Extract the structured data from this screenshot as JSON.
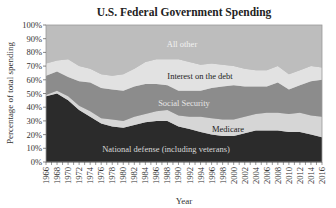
{
  "chart_data": {
    "type": "area",
    "stacked": true,
    "title": "U.S. Federal Government Spending",
    "xlabel": "Year",
    "ylabel": "Percentage of total spending",
    "ylim": [
      0,
      100
    ],
    "yticks": [
      "0%",
      "10%",
      "20%",
      "30%",
      "40%",
      "50%",
      "60%",
      "70%",
      "80%",
      "90%",
      "100%"
    ],
    "x": [
      1966,
      1968,
      1970,
      1972,
      1974,
      1976,
      1978,
      1980,
      1982,
      1984,
      1986,
      1988,
      1990,
      1992,
      1994,
      1996,
      1998,
      2000,
      2002,
      2004,
      2006,
      2008,
      2010,
      2012,
      2014,
      2016
    ],
    "xticks": [
      "1966",
      "1968",
      "1970",
      "1972",
      "1974",
      "1976",
      "1978",
      "1980",
      "1982",
      "1984",
      "1986",
      "1988",
      "1990",
      "1992",
      "1994",
      "1996",
      "1998",
      "2000",
      "2002",
      "2004",
      "2006",
      "2008",
      "2010",
      "2012",
      "2014",
      "2016"
    ],
    "grid": false,
    "series": [
      {
        "name": "National defense (including veterans)",
        "color": "#2b2b2b",
        "label_color": "#d8d8d8",
        "values": [
          48,
          50,
          45,
          38,
          33,
          28,
          26,
          25,
          27,
          29,
          30,
          30,
          26,
          24,
          22,
          20,
          19,
          19,
          21,
          23,
          23,
          23,
          22,
          22,
          20,
          18
        ]
      },
      {
        "name": "Medicare",
        "color": "#d6d6d6",
        "label_color": "#222222",
        "values": [
          1,
          2,
          3,
          3,
          4,
          4,
          5,
          5,
          6,
          6,
          7,
          8,
          8,
          9,
          11,
          12,
          12,
          12,
          12,
          12,
          13,
          13,
          13,
          14,
          14,
          15
        ]
      },
      {
        "name": "Social Security",
        "color": "#8c8c8c",
        "label_color": "#e6e6e6",
        "values": [
          14,
          14,
          14,
          18,
          21,
          22,
          22,
          22,
          22,
          22,
          20,
          18,
          18,
          19,
          19,
          22,
          24,
          25,
          22,
          20,
          19,
          22,
          18,
          20,
          25,
          27
        ]
      },
      {
        "name": "Interest on the debt",
        "color": "#e2e2e2",
        "label_color": "#222222",
        "values": [
          9,
          8,
          13,
          11,
          10,
          10,
          10,
          12,
          13,
          16,
          18,
          19,
          23,
          21,
          19,
          18,
          16,
          14,
          13,
          12,
          12,
          12,
          11,
          11,
          11,
          9
        ]
      },
      {
        "name": "All other",
        "color": "#bdbdbd",
        "label_color": "#f2f2f2",
        "values": [
          28,
          26,
          25,
          30,
          32,
          36,
          37,
          36,
          32,
          27,
          25,
          25,
          25,
          27,
          29,
          28,
          29,
          30,
          32,
          33,
          33,
          30,
          36,
          33,
          30,
          31
        ]
      }
    ],
    "legend": "inline labels"
  },
  "labels": {
    "title": "U.S. Federal Government Spending",
    "xlabel": "Year",
    "ylabel": "Percentage of total spending",
    "all_other": "All other",
    "interest": "Interest on the debt",
    "social_security": "Social Security",
    "medicare": "Medicare",
    "defense": "National defense (including veterans)"
  }
}
